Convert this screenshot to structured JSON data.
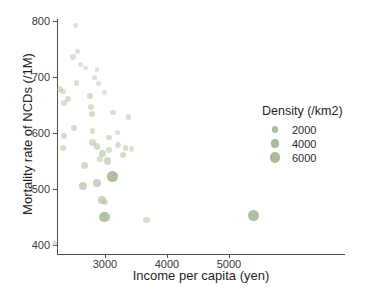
{
  "chart_data": {
    "type": "scatter",
    "title": "",
    "xlabel": "Income per capita (yen)",
    "ylabel": "Mortality rate of NCDs (/1M)",
    "xlim": [
      2100,
      5750
    ],
    "ylim": [
      385,
      810
    ],
    "xticks": [
      3000,
      4000,
      5000
    ],
    "xtick_labels": [
      "3000",
      "4000",
      "5000"
    ],
    "yticks": [
      400,
      500,
      600,
      700,
      800
    ],
    "ytick_labels": [
      "400",
      "500",
      "600",
      "700",
      "800"
    ],
    "grid": false,
    "point_color": "#a9bb9a",
    "size_encoding": "Density (/km2)",
    "legend": {
      "position": "right",
      "title": "Density (/km2)",
      "entries": [
        {
          "label": "2000",
          "value": 2000,
          "radius_px": 3.1
        },
        {
          "label": "4000",
          "value": 4000,
          "radius_px": 4.3
        },
        {
          "label": "6000",
          "value": 6000,
          "radius_px": 5.4
        }
      ]
    },
    "points": [
      {
        "x": 2190,
        "y": 402,
        "density": 700
      },
      {
        "x": 2530,
        "y": 792,
        "density": 600
      },
      {
        "x": 2560,
        "y": 745,
        "density": 700
      },
      {
        "x": 2480,
        "y": 736,
        "density": 900
      },
      {
        "x": 2610,
        "y": 723,
        "density": 600
      },
      {
        "x": 2690,
        "y": 716,
        "density": 500
      },
      {
        "x": 2870,
        "y": 713,
        "density": 500
      },
      {
        "x": 2830,
        "y": 699,
        "density": 900
      },
      {
        "x": 2540,
        "y": 690,
        "density": 1100
      },
      {
        "x": 2900,
        "y": 688,
        "density": 700
      },
      {
        "x": 2280,
        "y": 678,
        "density": 1000
      },
      {
        "x": 2320,
        "y": 674,
        "density": 900
      },
      {
        "x": 2990,
        "y": 672,
        "density": 600
      },
      {
        "x": 2760,
        "y": 666,
        "density": 1100
      },
      {
        "x": 2400,
        "y": 660,
        "density": 1200
      },
      {
        "x": 2340,
        "y": 653,
        "density": 1000
      },
      {
        "x": 2780,
        "y": 646,
        "density": 1300
      },
      {
        "x": 3130,
        "y": 637,
        "density": 800
      },
      {
        "x": 2790,
        "y": 634,
        "density": 1500
      },
      {
        "x": 3380,
        "y": 629,
        "density": 900
      },
      {
        "x": 2500,
        "y": 609,
        "density": 1200
      },
      {
        "x": 2800,
        "y": 604,
        "density": 1000
      },
      {
        "x": 3200,
        "y": 601,
        "density": 900
      },
      {
        "x": 2340,
        "y": 595,
        "density": 1400
      },
      {
        "x": 3060,
        "y": 592,
        "density": 1100
      },
      {
        "x": 2800,
        "y": 583,
        "density": 1300
      },
      {
        "x": 3210,
        "y": 579,
        "density": 1100
      },
      {
        "x": 2870,
        "y": 576,
        "density": 1500
      },
      {
        "x": 3330,
        "y": 574,
        "density": 1100
      },
      {
        "x": 2320,
        "y": 573,
        "density": 1200
      },
      {
        "x": 3430,
        "y": 571,
        "density": 900
      },
      {
        "x": 3060,
        "y": 569,
        "density": 1200
      },
      {
        "x": 2960,
        "y": 564,
        "density": 1600
      },
      {
        "x": 3290,
        "y": 561,
        "density": 1400
      },
      {
        "x": 2920,
        "y": 553,
        "density": 1000
      },
      {
        "x": 3040,
        "y": 550,
        "density": 2000
      },
      {
        "x": 2670,
        "y": 542,
        "density": 1700
      },
      {
        "x": 3120,
        "y": 523,
        "density": 5500
      },
      {
        "x": 2870,
        "y": 511,
        "density": 2600
      },
      {
        "x": 2650,
        "y": 506,
        "density": 2400
      },
      {
        "x": 2950,
        "y": 481,
        "density": 2300
      },
      {
        "x": 3000,
        "y": 477,
        "density": 1100
      },
      {
        "x": 2990,
        "y": 450,
        "density": 5000
      },
      {
        "x": 3670,
        "y": 445,
        "density": 1400
      },
      {
        "x": 5400,
        "y": 452,
        "density": 5300
      }
    ]
  }
}
